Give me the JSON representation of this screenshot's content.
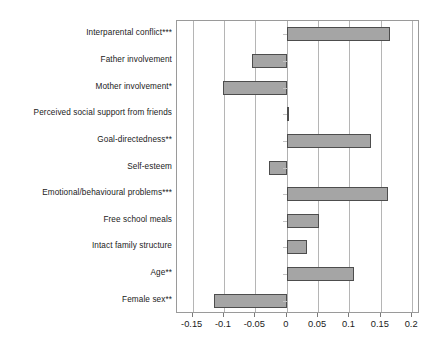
{
  "chart_data": {
    "type": "bar",
    "orientation": "horizontal",
    "title": "",
    "subtitle": "",
    "xlabel": "",
    "ylabel": "",
    "xlim": [
      -0.175,
      0.2125
    ],
    "xticks": [
      -0.15,
      -0.1,
      -0.05,
      0,
      0.05,
      0.1,
      0.15,
      0.2
    ],
    "xtick_labels": [
      "-0.15",
      "-0.1",
      "-0.05",
      "0",
      "0.05",
      "0.1",
      "0.15",
      "0.2"
    ],
    "grid": true,
    "grid_axis": "x",
    "legend": false,
    "legend_position": "none",
    "bar_fill_color": "#a5a5a5",
    "bar_border_color": "#4d4d4d",
    "categories": [
      "Interparental conflict***",
      "Father involvement",
      "Mother involvement*",
      "Perceived social support from friends",
      "Goal-directedness**",
      "Self-esteem",
      "Emotional/behavioural problems***",
      "Free school meals",
      "Intact family structure",
      "Age**",
      "Female sex**"
    ],
    "values": [
      0.164,
      -0.056,
      -0.102,
      0.004,
      0.134,
      -0.028,
      0.162,
      0.051,
      0.032,
      0.107,
      -0.116
    ],
    "series": [
      {
        "name": "Standardised coefficient",
        "values": [
          0.164,
          -0.056,
          -0.102,
          0.004,
          0.134,
          -0.028,
          0.162,
          0.051,
          0.032,
          0.107,
          -0.116
        ]
      }
    ],
    "annotations": [
      "*** p < 0.001",
      "** p < 0.01",
      "* p < 0.05"
    ]
  }
}
